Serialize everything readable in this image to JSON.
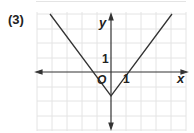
{
  "problem": {
    "label": "(3)"
  },
  "axes": {
    "x_label": "x",
    "y_label": "y",
    "origin_label": "O",
    "x_tick_label": "1",
    "y_tick_label": "1"
  },
  "graph": {
    "function_description": "V-shaped absolute value graph with vertex below origin on y-axis",
    "vertex": [
      0,
      -1.6
    ],
    "x_intercepts": [
      -1.3,
      1.1
    ],
    "grid_unit_px": 14.7,
    "line_color": "#333333",
    "grid_color": "#e2e2e2"
  }
}
